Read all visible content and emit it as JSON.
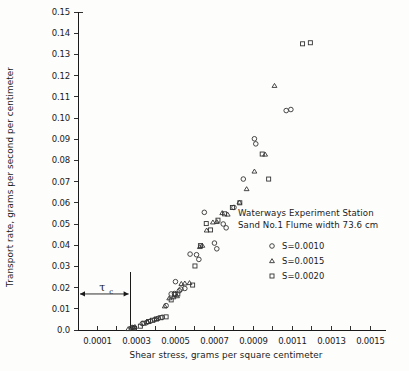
{
  "chart_data": {
    "type": "scatter",
    "title": "",
    "xlabel": "Shear stress, grams per square centimeter",
    "ylabel": "Transport rate, grams per second per centimeter",
    "xlim": [
      0.0,
      0.0158
    ],
    "ylim": [
      0.0,
      0.15
    ],
    "grid": false,
    "legend_position": "center-right",
    "xticks": [
      0.001,
      0.002,
      0.003,
      0.004,
      0.005,
      0.006,
      0.007,
      0.008,
      0.009,
      0.01,
      0.011,
      0.012,
      0.013,
      0.014,
      0.015
    ],
    "xtick_labels": [
      "0.0001",
      "",
      "0.0003",
      "",
      "0.0005",
      "",
      "0.0007",
      "",
      "0.0009",
      "",
      "0.0011",
      "",
      "0.0013",
      "",
      "0.0015"
    ],
    "xtick_labels_visible": [
      "0.0001",
      "0.0003",
      "0.0005",
      "0.0007",
      "0.0009",
      "0.0011",
      "0.0013",
      "0.0015"
    ],
    "yticks": [
      0.0,
      0.01,
      0.02,
      0.03,
      0.04,
      0.05,
      0.06,
      0.07,
      0.08,
      0.09,
      0.1,
      0.11,
      0.12,
      0.13,
      0.14,
      0.15
    ],
    "ytick_labels": [
      "0.0",
      "0.01",
      "0.02",
      "0.03",
      "0.04",
      "0.05",
      "0.06",
      "0.07",
      "0.08",
      "0.09",
      "0.10",
      "0.11",
      "0.12",
      "0.13",
      "0.14",
      "0.15"
    ],
    "annotations": [
      {
        "name": "critical-shear-stress",
        "label": "τ",
        "subscript": "c",
        "type": "span-arrow",
        "x_start": 0.0,
        "x_end": 0.0027,
        "y": 0.017
      }
    ],
    "series": [
      {
        "name": "S=0.0010",
        "marker": "circle",
        "marker_style": "open",
        "points": [
          [
            0.00272,
            0.0008
          ],
          [
            0.00278,
            0.0012
          ],
          [
            0.00285,
            0.001
          ],
          [
            0.0033,
            0.003
          ],
          [
            0.00352,
            0.0035
          ],
          [
            0.00372,
            0.0042
          ],
          [
            0.00392,
            0.0048
          ],
          [
            0.00412,
            0.0055
          ],
          [
            0.00432,
            0.006
          ],
          [
            0.00452,
            0.0115
          ],
          [
            0.00478,
            0.017
          ],
          [
            0.00495,
            0.0172
          ],
          [
            0.005,
            0.0228
          ],
          [
            0.0052,
            0.0185
          ],
          [
            0.00528,
            0.0193
          ],
          [
            0.00548,
            0.0196
          ],
          [
            0.00575,
            0.0358
          ],
          [
            0.00608,
            0.0355
          ],
          [
            0.0062,
            0.0333
          ],
          [
            0.00648,
            0.0555
          ],
          [
            0.007,
            0.041
          ],
          [
            0.00712,
            0.0383
          ],
          [
            0.00745,
            0.05
          ],
          [
            0.0076,
            0.0482
          ],
          [
            0.008,
            0.0578
          ],
          [
            0.00848,
            0.0712
          ],
          [
            0.00905,
            0.0902
          ],
          [
            0.00912,
            0.0878
          ],
          [
            0.01068,
            0.1035
          ],
          [
            0.01092,
            0.104
          ]
        ]
      },
      {
        "name": "S=0.0015",
        "marker": "triangle",
        "marker_style": "open",
        "points": [
          [
            0.00258,
            0.0005
          ],
          [
            0.00283,
            0.0012
          ],
          [
            0.00292,
            0.0015
          ],
          [
            0.00358,
            0.0038
          ],
          [
            0.00402,
            0.0052
          ],
          [
            0.00445,
            0.0112
          ],
          [
            0.00468,
            0.015
          ],
          [
            0.0049,
            0.0155
          ],
          [
            0.00508,
            0.016
          ],
          [
            0.0053,
            0.0218
          ],
          [
            0.00548,
            0.022
          ],
          [
            0.00572,
            0.0222
          ],
          [
            0.00625,
            0.0392
          ],
          [
            0.00638,
            0.0398
          ],
          [
            0.0066,
            0.047
          ],
          [
            0.00692,
            0.0508
          ],
          [
            0.00712,
            0.051
          ],
          [
            0.0074,
            0.0552
          ],
          [
            0.00768,
            0.0545
          ],
          [
            0.00828,
            0.0602
          ],
          [
            0.00865,
            0.0665
          ],
          [
            0.00905,
            0.0748
          ],
          [
            0.0096,
            0.0828
          ],
          [
            0.01008,
            0.1152
          ]
        ]
      },
      {
        "name": "S=0.0020",
        "marker": "square",
        "marker_style": "open",
        "points": [
          [
            0.0029,
            0.0008
          ],
          [
            0.0032,
            0.0018
          ],
          [
            0.00338,
            0.0032
          ],
          [
            0.00362,
            0.004
          ],
          [
            0.00382,
            0.0046
          ],
          [
            0.00402,
            0.0052
          ],
          [
            0.00425,
            0.0058
          ],
          [
            0.00452,
            0.0062
          ],
          [
            0.00478,
            0.0142
          ],
          [
            0.00498,
            0.0168
          ],
          [
            0.00512,
            0.017
          ],
          [
            0.00588,
            0.0212
          ],
          [
            0.006,
            0.0302
          ],
          [
            0.00628,
            0.0398
          ],
          [
            0.00658,
            0.0502
          ],
          [
            0.0068,
            0.0472
          ],
          [
            0.00718,
            0.0518
          ],
          [
            0.00752,
            0.0548
          ],
          [
            0.00792,
            0.0578
          ],
          [
            0.0083,
            0.06
          ],
          [
            0.00945,
            0.083
          ],
          [
            0.00978,
            0.0712
          ],
          [
            0.01152,
            0.135
          ],
          [
            0.01192,
            0.1355
          ]
        ]
      }
    ]
  },
  "legend": {
    "line1": "Waterways Experiment Station",
    "line2": "Sand No.1  Flume width 73.6 cm",
    "entries": [
      {
        "marker": "circle",
        "label": "S=0.0010"
      },
      {
        "marker": "triangle",
        "label": "S=0.0015"
      },
      {
        "marker": "square",
        "label": "S=0.0020"
      }
    ]
  }
}
